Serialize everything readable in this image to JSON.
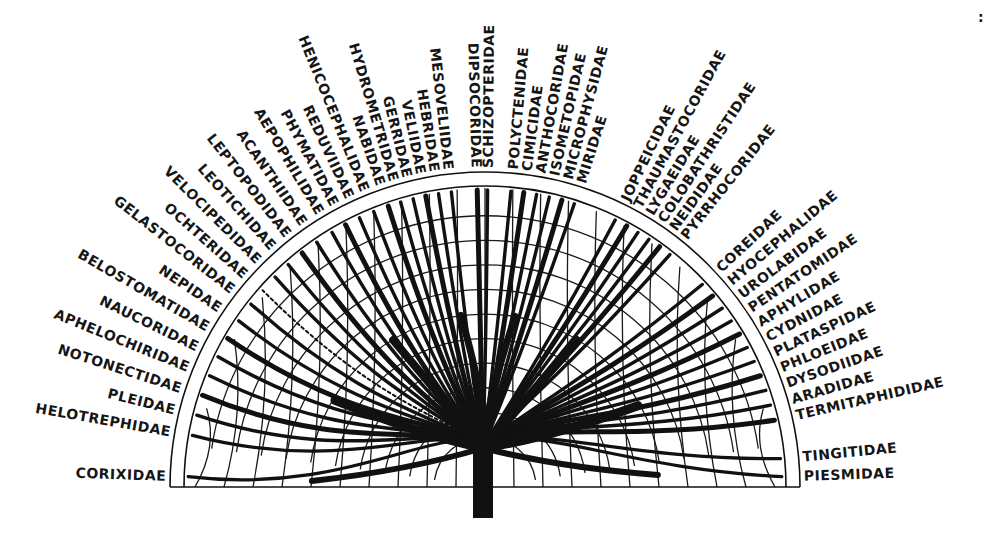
{
  "figure": {
    "type": "phylogenetic-fan-diagram",
    "center": {
      "x": 485,
      "y": 487
    },
    "outer_radius": 315,
    "trunk": {
      "x": 483,
      "top": 440,
      "bottom": 518,
      "width": 20
    },
    "colors": {
      "ink": "#111111",
      "background": "#ffffff"
    },
    "corner_mark": ":"
  },
  "labels": {
    "left": [
      {
        "name": "CORIXIDAE",
        "angle": 178
      },
      {
        "name": "HELOTREPHIDAE",
        "angle": 170
      },
      {
        "name": "PLEIDAE",
        "angle": 166
      },
      {
        "name": "NOTONECTIDAE",
        "angle": 162
      },
      {
        "name": "APHELOCHIRIDAE",
        "angle": 158
      },
      {
        "name": "NAUCORIDAE",
        "angle": 154
      },
      {
        "name": "BELOSTOMATIDAE",
        "angle": 150
      },
      {
        "name": "NEPIDAE",
        "angle": 146
      },
      {
        "name": "GELASTOCORIDAE",
        "angle": 142
      },
      {
        "name": "OCHTERIDAE",
        "angle": 138.5
      },
      {
        "name": "VELOCIPEDIDAE",
        "angle": 135
      },
      {
        "name": "LEOTICHIDAE",
        "angle": 131.5
      },
      {
        "name": "LEPTOPODIDAE",
        "angle": 128
      },
      {
        "name": "ACANTHIIDAE",
        "angle": 124.5
      },
      {
        "name": "AEPOPHILIDAE",
        "angle": 121
      },
      {
        "name": "PHYMATIDAE",
        "angle": 118
      },
      {
        "name": "REDUVIIDAE",
        "angle": 115
      },
      {
        "name": "HENICOCEPHALIDAE",
        "angle": 112
      },
      {
        "name": "NABIDAE",
        "angle": 109
      },
      {
        "name": "HYDROMETRIDAE",
        "angle": 106.5
      },
      {
        "name": "GERRIDAE",
        "angle": 104
      },
      {
        "name": "VELIIDAE",
        "angle": 101.5
      },
      {
        "name": "HEBRIDAE",
        "angle": 99
      },
      {
        "name": "MESOVELIIDAE",
        "angle": 96.5
      }
    ],
    "top": [
      {
        "name": "DIPSOCORIDAE",
        "angle": 91.5
      },
      {
        "name": "SCHIZOPTERIDAE",
        "angle": 89.5
      },
      {
        "name": "POLYCTENIDAE",
        "angle": 85
      },
      {
        "name": "CIMICIDAE",
        "angle": 82.5
      },
      {
        "name": "ANTHOCORIDAE",
        "angle": 80
      },
      {
        "name": "ISOMETOPIDAE",
        "angle": 77.5
      },
      {
        "name": "MICROPHYSIDAE",
        "angle": 75
      },
      {
        "name": "MIRIDAE",
        "angle": 72.5
      }
    ],
    "right": [
      {
        "name": "JOPPEICIDAE",
        "angle": 64
      },
      {
        "name": "THAUMASTOCORIDAE",
        "angle": 61.5
      },
      {
        "name": "LYGAEIDAE",
        "angle": 59
      },
      {
        "name": "COLOBATHRISTIDAE",
        "angle": 56.5
      },
      {
        "name": "NEIDIDAE",
        "angle": 54
      },
      {
        "name": "PYRRHOCORIDAE",
        "angle": 51.5
      },
      {
        "name": "COREIDAE",
        "angle": 43
      },
      {
        "name": "HYOCEPHALIDAE",
        "angle": 40
      },
      {
        "name": "UROLABIDAE",
        "angle": 37
      },
      {
        "name": "PENTATOMIDAE",
        "angle": 34
      },
      {
        "name": "APHYLIDAE",
        "angle": 31
      },
      {
        "name": "CYDNIDAE",
        "angle": 28
      },
      {
        "name": "PLATASPIDAE",
        "angle": 25
      },
      {
        "name": "PHLOEIDAE",
        "angle": 22
      },
      {
        "name": "DYSODIIDAE",
        "angle": 19
      },
      {
        "name": "ARADIDAE",
        "angle": 16
      },
      {
        "name": "TERMITAPHIDIDAE",
        "angle": 13
      },
      {
        "name": "TINGITIDAE",
        "angle": 5.5
      },
      {
        "name": "PIESMIDAE",
        "angle": 2
      }
    ]
  }
}
